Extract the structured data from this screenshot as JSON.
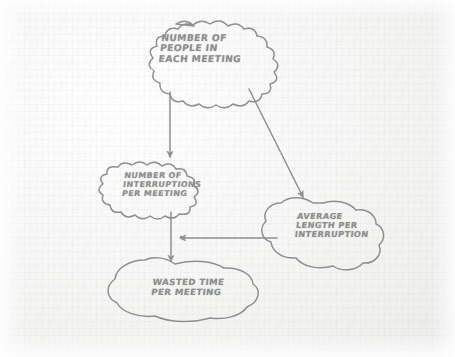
{
  "diagram": {
    "kind": "hand-drawn-causal-loop-diagram",
    "medium": "pencil sketch on textured paper",
    "ink_color": "#8d8d8d",
    "paper_color": "#f4f4f3",
    "nodes": [
      {
        "id": "people",
        "shape": "scalloped-cloud",
        "text": "NUMBER OF\nPEOPLE IN\nEACH MEETING",
        "lines": [
          "NUMBER OF",
          "PEOPLE IN",
          "EACH MEETING"
        ]
      },
      {
        "id": "interruptions",
        "shape": "scalloped-cloud",
        "text": "NUMBER OF\nINTERRUPTIONS\nPER MEETING",
        "lines": [
          "NUMBER OF",
          "INTERRUPTIONS",
          "PER MEETING"
        ]
      },
      {
        "id": "average",
        "shape": "blob-cloud",
        "text": "AVERAGE\nLENGTH PER\nINTERRUPTION",
        "lines": [
          "AVERAGE",
          "LENGTH PER",
          "INTERRUPTION"
        ]
      },
      {
        "id": "wasted",
        "shape": "blob-cloud",
        "text": "WASTED TIME\nPER MEETING",
        "lines": [
          "WASTED TIME",
          "PER MEETING"
        ]
      }
    ],
    "edges": [
      {
        "id": "people-to-interruptions",
        "from": "people",
        "to": "interruptions",
        "style": "straight-arrow",
        "direction": "down"
      },
      {
        "id": "people-to-average",
        "from": "people",
        "to": "average",
        "style": "straight-arrow",
        "direction": "down-right"
      },
      {
        "id": "interruptions-to-wasted",
        "from": "interruptions",
        "to": "wasted",
        "style": "straight-arrow",
        "direction": "down"
      },
      {
        "id": "average-to-wasted",
        "from": "average",
        "to": "wasted",
        "style": "straight-arrow",
        "direction": "left"
      }
    ]
  }
}
